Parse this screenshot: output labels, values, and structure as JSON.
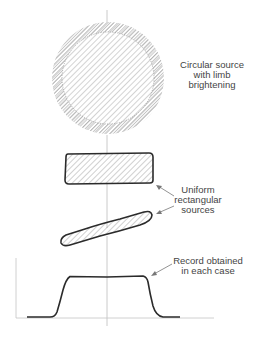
{
  "figure": {
    "labels": {
      "circular": [
        "Circular source",
        "with limb",
        "brightening"
      ],
      "rectangular": [
        "Uniform",
        "rectangular",
        "sources"
      ],
      "record": [
        "Record obtained",
        "in each case"
      ]
    },
    "colors": {
      "outline": "#2b2b2b",
      "hatch": "#9a9a9a",
      "axis": "#bdbdbd",
      "text": "#444444"
    },
    "sources": [
      {
        "name": "circular-source",
        "shape": "circle",
        "cx": 108,
        "cy": 78,
        "r": 56,
        "limb_brightening": true
      },
      {
        "name": "rectangular-source-horizontal",
        "shape": "rectangle",
        "x": 65,
        "y": 153,
        "width": 88,
        "height": 31
      },
      {
        "name": "rectangular-source-oblique",
        "shape": "slanted-strip",
        "from": [
          63,
          243
        ],
        "to": [
          152,
          213
        ]
      }
    ],
    "record": {
      "type": "line",
      "description": "Flat-topped profile with steep edges",
      "axis_origin": [
        16,
        318
      ],
      "x_axis_end": 214,
      "y_axis_top": 258,
      "curve_points": [
        [
          27,
          317
        ],
        [
          50,
          317
        ],
        [
          56,
          314
        ],
        [
          60,
          304
        ],
        [
          64,
          288
        ],
        [
          68,
          278
        ],
        [
          72,
          276
        ],
        [
          107,
          277
        ],
        [
          143,
          276
        ],
        [
          147,
          279
        ],
        [
          150,
          292
        ],
        [
          153,
          307
        ],
        [
          157,
          315
        ],
        [
          162,
          317
        ],
        [
          180,
          317
        ]
      ]
    }
  }
}
